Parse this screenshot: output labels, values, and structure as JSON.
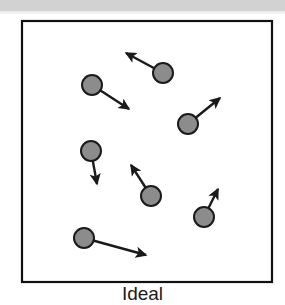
{
  "figure": {
    "caption": "Ideal",
    "box": {
      "x": 21,
      "y": 20,
      "width": 252,
      "height": 263,
      "border_color": "#111111",
      "border_width": 2,
      "fill": "#ffffff"
    },
    "top_band": {
      "color": "#d2d2d2",
      "height": 13
    },
    "particle_style": {
      "fill": "#8c8c8c",
      "stroke": "#1a1a1a",
      "stroke_width": 2,
      "radius": 10
    },
    "arrow_style": {
      "color": "#1a1a1a",
      "width": 2.4
    },
    "particles": [
      {
        "id": "particle-1",
        "cx": 163,
        "cy": 73,
        "vx_tip_x": 123,
        "vx_tip_y": 51,
        "label": "up-left"
      },
      {
        "id": "particle-2",
        "cx": 92,
        "cy": 85,
        "vx_tip_x": 132,
        "vx_tip_y": 112,
        "label": "down-right"
      },
      {
        "id": "particle-3",
        "cx": 188,
        "cy": 124,
        "vx_tip_x": 223,
        "vx_tip_y": 95,
        "label": "up-right"
      },
      {
        "id": "particle-4",
        "cx": 91,
        "cy": 151,
        "vx_tip_x": 98,
        "vx_tip_y": 188,
        "label": "down"
      },
      {
        "id": "particle-5",
        "cx": 151,
        "cy": 196,
        "vx_tip_x": 129,
        "vx_tip_y": 162,
        "label": "up-left"
      },
      {
        "id": "particle-6",
        "cx": 204,
        "cy": 217,
        "vx_tip_x": 220,
        "vx_tip_y": 185,
        "label": "up-right"
      },
      {
        "id": "particle-7",
        "cx": 84,
        "cy": 238,
        "vx_tip_x": 150,
        "vx_tip_y": 256,
        "label": "right-down"
      }
    ]
  }
}
